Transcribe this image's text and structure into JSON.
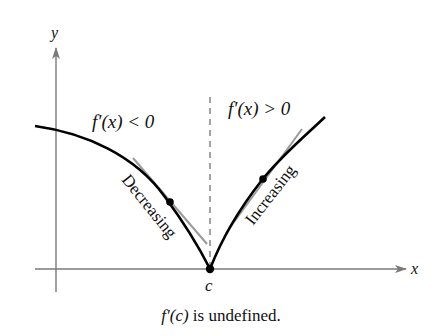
{
  "figure": {
    "axes": {
      "x_label": "x",
      "y_label": "y",
      "axis_color": "#7a7a7a"
    },
    "point_label": "c",
    "regions": {
      "left": {
        "condition": "f′(x) < 0",
        "behavior": "Decreasing"
      },
      "right": {
        "condition": "f′(x) > 0",
        "behavior": "Increasing"
      }
    },
    "curve_color": "#000000",
    "tangent_color": "#9a9a9a",
    "dashed_line_color": "#666666",
    "caption": {
      "func": "f′(c)",
      "text": " is undefined."
    }
  }
}
